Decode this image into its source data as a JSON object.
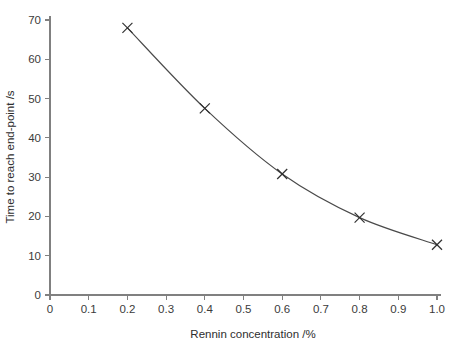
{
  "chart_data": {
    "type": "line",
    "title": "",
    "subtitle": "",
    "xlabel": "Rennin concentration /%",
    "ylabel": "Time to reach end-point /s",
    "xlim": [
      0,
      1.0
    ],
    "ylim": [
      0,
      70
    ],
    "grid": false,
    "legend": null,
    "marker": "x",
    "line_style": "smooth-curve",
    "line_color": "#4a4a4a",
    "marker_color": "#303030",
    "axis_color": "#808080",
    "x_ticks": [
      0,
      0.1,
      0.2,
      0.3,
      0.4,
      0.5,
      0.6,
      0.7,
      0.8,
      0.9,
      1.0
    ],
    "x_tick_labels": [
      "0",
      "0.1",
      "0.2",
      "0.3",
      "0.4",
      "0.5",
      "0.6",
      "0.7",
      "0.8",
      "0.9",
      "1.0"
    ],
    "y_ticks": [
      0,
      10,
      20,
      30,
      40,
      50,
      60,
      70
    ],
    "y_tick_labels": [
      "0",
      "10",
      "20",
      "30",
      "40",
      "50",
      "60",
      "70"
    ],
    "x": [
      0.2,
      0.4,
      0.6,
      0.8,
      1.0
    ],
    "values": [
      68.0,
      47.5,
      30.8,
      19.7,
      12.8
    ],
    "series": [
      {
        "name": "Time to reach end-point",
        "x": [
          0.2,
          0.4,
          0.6,
          0.8,
          1.0
        ],
        "values": [
          68.0,
          47.5,
          30.8,
          19.7,
          12.8
        ]
      }
    ],
    "points": [
      {
        "x": 0.2,
        "y": 68.0
      },
      {
        "x": 0.4,
        "y": 47.5
      },
      {
        "x": 0.6,
        "y": 30.8
      },
      {
        "x": 0.8,
        "y": 19.7
      },
      {
        "x": 1.0,
        "y": 12.8
      }
    ],
    "annotations": []
  }
}
